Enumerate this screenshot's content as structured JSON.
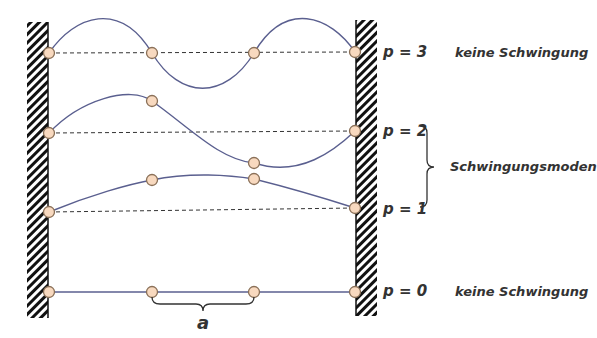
{
  "diagram": {
    "title": "",
    "walls": {
      "left_x": [
        27,
        48
      ],
      "right_x": [
        355,
        377
      ],
      "hatch_color": "#111111"
    },
    "colors": {
      "string": "#5a5f8f",
      "baseline": "#333333",
      "atom_fill": "#f8d9bf",
      "atom_stroke": "#8a7058",
      "text": "#333333"
    },
    "atom_x": [
      49,
      152,
      254,
      355
    ],
    "modes": [
      {
        "p": 3,
        "label": "p = 3",
        "description": "keine Schwingung",
        "baseline_y": 53,
        "atom_y": [
          53,
          53,
          53,
          53
        ]
      },
      {
        "p": 2,
        "label": "p = 2",
        "description": "",
        "baseline_y": 132,
        "atom_y": [
          133,
          101,
          163,
          131
        ]
      },
      {
        "p": 1,
        "label": "p = 1",
        "description": "",
        "baseline_y": 210,
        "atom_y": [
          212,
          180,
          179,
          208
        ]
      },
      {
        "p": 0,
        "label": "p = 0",
        "description": "keine Schwingung",
        "baseline_y": 292,
        "atom_y": [
          292,
          292,
          292,
          292
        ]
      }
    ],
    "group_label": "Schwingungsmoden",
    "spacing_label": "a"
  }
}
